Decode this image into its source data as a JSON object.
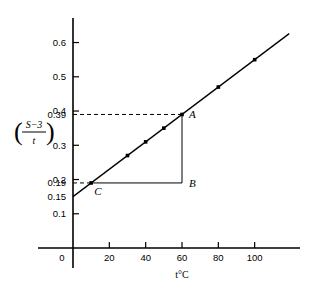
{
  "chart_data": {
    "type": "line",
    "title": "",
    "xlabel": "t°C",
    "ylabel": "(S−3)/t",
    "ylabel_parts": {
      "numerator": "S−3",
      "denominator": "t"
    },
    "xlim": [
      0,
      120
    ],
    "ylim": [
      0,
      0.66
    ],
    "xticks": [
      0,
      20,
      40,
      60,
      80,
      100
    ],
    "xtick_labels": [
      "0",
      "20",
      "40",
      "60",
      "80",
      "100"
    ],
    "yticks": [
      0.1,
      0.2,
      0.3,
      0.4,
      0.5,
      0.6
    ],
    "ytick_labels": [
      "0.1",
      "0.2",
      "0.3",
      "0.4",
      "0.5",
      "0.6"
    ],
    "extra_ylabels": [
      {
        "value": 0.39,
        "label": "0.39"
      },
      {
        "value": 0.19,
        "label": "0.19"
      },
      {
        "value": 0.15,
        "label": "0.15"
      }
    ],
    "grid": false,
    "legend": false,
    "x": [
      10,
      30,
      40,
      50,
      60,
      80,
      100
    ],
    "y": [
      0.19,
      0.27,
      0.31,
      0.35,
      0.39,
      0.47,
      0.55
    ],
    "series": [
      {
        "name": "(S-3)/t vs t",
        "x": [
          10,
          30,
          40,
          50,
          60,
          80,
          100
        ],
        "values": [
          0.19,
          0.27,
          0.31,
          0.35,
          0.39,
          0.47,
          0.55
        ]
      }
    ],
    "fit_line": {
      "intercept": 0.15,
      "slope": 0.004,
      "x_start": 0,
      "x_end": 119
    },
    "annotations": [
      {
        "name": "A",
        "label": "A",
        "x": 60,
        "y": 0.39
      },
      {
        "name": "B",
        "label": "B",
        "x": 60,
        "y": 0.19
      },
      {
        "name": "C",
        "label": "C",
        "x": 10,
        "y": 0.19
      }
    ],
    "construction": {
      "triangle": [
        "A",
        "B",
        "C"
      ],
      "dashed_lines": [
        {
          "from_axis": "y",
          "value": 0.39,
          "to_x": 60
        },
        {
          "from_axis": "y",
          "value": 0.19,
          "to_x": 10
        }
      ]
    },
    "colors": {
      "line": "#000000",
      "marker": "#000000",
      "axis": "#000000",
      "dashed": "#000000"
    }
  }
}
